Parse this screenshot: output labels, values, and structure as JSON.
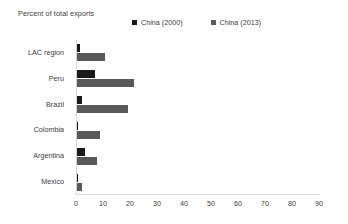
{
  "chart_data": {
    "type": "bar",
    "orientation": "horizontal",
    "title": "Percent of total exports",
    "xlabel": "",
    "ylabel": "",
    "xlim": [
      0,
      90
    ],
    "xticks": [
      0,
      10,
      20,
      30,
      40,
      50,
      60,
      70,
      80,
      90
    ],
    "grid": false,
    "legend_position": "top",
    "categories": [
      "LAC region",
      "Peru",
      "Brazil",
      "Colombia",
      "Argentina",
      "Mexico"
    ],
    "series": [
      {
        "name": "China (2000)",
        "color": "#1a1a1a",
        "values": [
          1.1,
          6.7,
          1.9,
          0.3,
          2.8,
          0.2
        ]
      },
      {
        "name": "China (2013)",
        "color": "#595959",
        "values": [
          10.5,
          21.0,
          19.0,
          8.7,
          7.5,
          1.7
        ]
      }
    ]
  },
  "legend": {
    "entries": [
      {
        "label": "China (2000)",
        "swatch": "legend-swatch-china-2000",
        "color": "#1a1a1a"
      },
      {
        "label": "China (2013)",
        "swatch": "legend-swatch-china-2013",
        "color": "#595959"
      }
    ]
  },
  "axis": {
    "title": "Percent of total exports",
    "tick_labels": [
      "0",
      "10",
      "20",
      "30",
      "40",
      "50",
      "60",
      "70",
      "80",
      "90"
    ]
  },
  "colors": {
    "background": "#ffffff",
    "text": "#3b3b3b",
    "axis_line": "#d5d5d5",
    "series_2000": "#1a1a1a",
    "series_2013": "#595959"
  }
}
